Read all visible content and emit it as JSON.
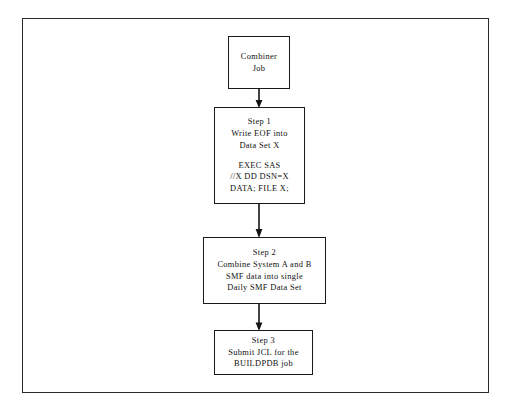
{
  "figure": {
    "frame_color": "#2a2a2a",
    "background": "#ffffff",
    "box_border_color": "#1a1a1a",
    "connector_color": "#151515"
  },
  "nodes": [
    {
      "id": "combiner-job",
      "lines": [
        "Combiner",
        "Job"
      ]
    },
    {
      "id": "step-1",
      "lines": [
        "Step 1",
        "Write EOF into",
        "Data Set X",
        "EXEC SAS",
        "//X DD DSN=X",
        "DATA; FILE X;"
      ]
    },
    {
      "id": "step-2",
      "lines": [
        "Step 2",
        "Combine System A and B",
        "SMF data into single",
        "Daily SMF Data Set"
      ]
    },
    {
      "id": "step-3",
      "lines": [
        "Step 3",
        "Submit JCL for the",
        "BUILDPDB job"
      ]
    }
  ],
  "connectors": [
    {
      "id": "combiner-to-step1",
      "from": "combiner-job",
      "to": "step-1",
      "direction": "down"
    },
    {
      "id": "step1-to-step2",
      "from": "step-1",
      "to": "step-2",
      "direction": "down"
    },
    {
      "id": "step2-to-step3",
      "from": "step-2",
      "to": "step-3",
      "direction": "down"
    }
  ]
}
